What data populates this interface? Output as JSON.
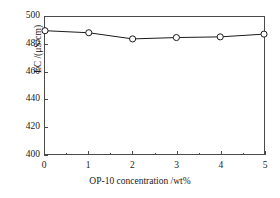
{
  "chart_data": {
    "type": "line",
    "title": "",
    "xlabel": "OP-10 concentration /wt%",
    "ylabel": "EC /(μS/cm)",
    "x": [
      0,
      1,
      2,
      3,
      4,
      5
    ],
    "values": [
      490.0,
      488.5,
      484.0,
      485.0,
      485.5,
      487.5
    ],
    "series": [
      {
        "name": "EC",
        "values": [
          490.0,
          488.5,
          484.0,
          485.0,
          485.5,
          487.5
        ]
      }
    ],
    "xlim": [
      0,
      5
    ],
    "ylim": [
      400,
      500
    ],
    "xticks": [
      0,
      1,
      2,
      3,
      4,
      5
    ],
    "yticks": [
      400,
      420,
      440,
      460,
      480,
      500
    ],
    "xtick_labels": [
      "0",
      "1",
      "2",
      "3",
      "4",
      "5"
    ],
    "ytick_labels": [
      "400",
      "420",
      "440",
      "460",
      "480",
      "500"
    ],
    "x_minor_ticks_per_interval": 1,
    "y_minor_ticks_per_interval": 0,
    "grid": false,
    "legend": null,
    "marker": "open-circle",
    "marker_face_color": "#ffffff",
    "line_color": "#1a1a1a",
    "frame_color": "#4a4a4a",
    "background_color": "#ffffff"
  }
}
